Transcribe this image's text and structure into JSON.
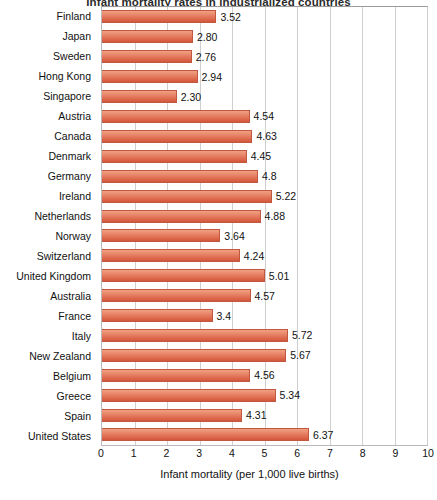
{
  "chart_data": {
    "type": "bar",
    "orientation": "horizontal",
    "title": "Infant mortality rates in industrialized countries",
    "xlabel": "Infant mortality (per 1,000 live births)",
    "ylabel": "",
    "xlim": [
      0,
      10
    ],
    "xticks": [
      "0",
      "1",
      "2",
      "3",
      "4",
      "5",
      "6",
      "7",
      "8",
      "9",
      "10"
    ],
    "grid": "vertical",
    "legend": "none",
    "bar_color": "#dd6a4e",
    "categories": [
      "Finland",
      "Japan",
      "Sweden",
      "Hong Kong",
      "Singapore",
      "Austria",
      "Canada",
      "Denmark",
      "Germany",
      "Ireland",
      "Netherlands",
      "Norway",
      "Switzerland",
      "United Kingdom",
      "Australia",
      "France",
      "Italy",
      "New Zealand",
      "Belgium",
      "Greece",
      "Spain",
      "United States"
    ],
    "values": [
      3.52,
      2.8,
      2.76,
      2.94,
      2.3,
      4.54,
      4.63,
      4.45,
      4.8,
      5.22,
      4.88,
      3.64,
      4.24,
      5.01,
      4.57,
      3.4,
      5.72,
      5.67,
      4.56,
      5.34,
      4.31,
      6.37
    ],
    "value_labels": [
      "3.52",
      "2.80",
      "2.76",
      "2.94",
      "2.30",
      "4.54",
      "4.63",
      "4.45",
      "4.8",
      "5.22",
      "4.88",
      "3.64",
      "4.24",
      "5.01",
      "4.57",
      "3.4",
      "5.72",
      "5.67",
      "4.56",
      "5.34",
      "4.31",
      "6.37"
    ]
  }
}
